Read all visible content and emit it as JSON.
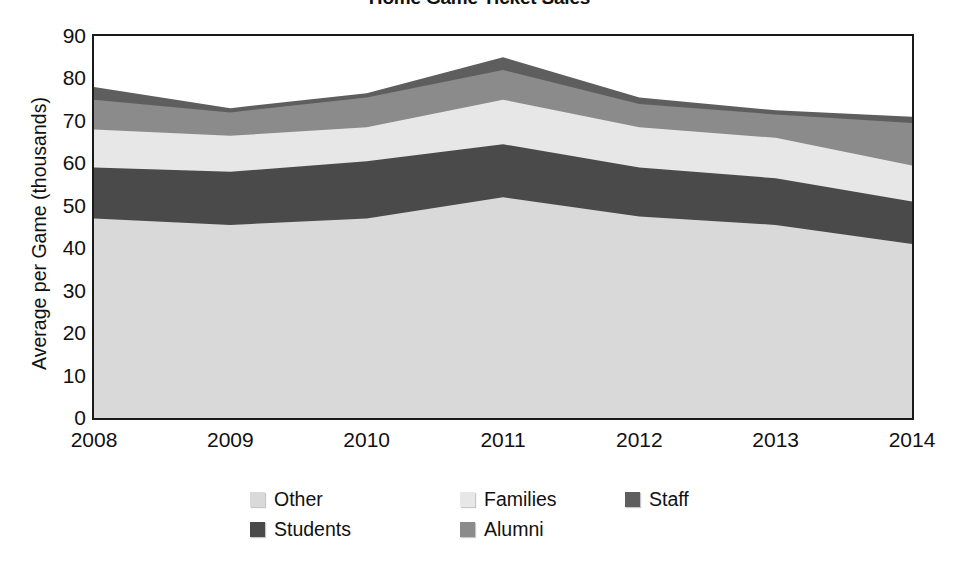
{
  "chart_data": {
    "type": "area",
    "stacked": true,
    "title": "Home Game Ticket Sales",
    "xlabel": "",
    "ylabel": "Average per Game (thousands)",
    "categories": [
      "2008",
      "2009",
      "2010",
      "2011",
      "2012",
      "2013",
      "2014"
    ],
    "x": [
      2008,
      2009,
      2010,
      2011,
      2012,
      2013,
      2014
    ],
    "ylim": [
      0,
      90
    ],
    "yticks": [
      "0",
      "10",
      "20",
      "30",
      "40",
      "50",
      "60",
      "70",
      "80",
      "90"
    ],
    "ytick_values": [
      0,
      10,
      20,
      30,
      40,
      50,
      60,
      70,
      80,
      90
    ],
    "grid": false,
    "legend_position": "bottom",
    "series": [
      {
        "name": "Other",
        "color": "#d9d9d9",
        "values": [
          47,
          45.5,
          47,
          52,
          47.5,
          45.5,
          41
        ],
        "cumulative": [
          47,
          45.5,
          47,
          52,
          47.5,
          45.5,
          41
        ]
      },
      {
        "name": "Students",
        "color": "#4a4a4a",
        "values": [
          12,
          12.5,
          13.5,
          12.5,
          11.5,
          11,
          10
        ],
        "cumulative": [
          59,
          58,
          60.5,
          64.5,
          59,
          56.5,
          51
        ]
      },
      {
        "name": "Families",
        "color": "#e7e7e7",
        "values": [
          9,
          8.5,
          8,
          10.5,
          9.5,
          9.5,
          8.5
        ],
        "cumulative": [
          68,
          66.5,
          68.5,
          75,
          68.5,
          66,
          59.5
        ]
      },
      {
        "name": "Alumni",
        "color": "#8b8b8b",
        "values": [
          7,
          5.5,
          7,
          7,
          5.5,
          5.5,
          10
        ],
        "cumulative": [
          75,
          72,
          75.5,
          82,
          74,
          71.5,
          69.5
        ]
      },
      {
        "name": "Staff",
        "color": "#5e5e5e",
        "values": [
          3,
          1,
          1,
          3,
          1.5,
          1,
          1.5
        ],
        "cumulative": [
          78,
          73,
          76.5,
          85,
          75.5,
          72.5,
          71
        ]
      }
    ],
    "legend_order": [
      "Other",
      "Families",
      "Staff",
      "Students",
      "Alumni"
    ]
  },
  "legend": {
    "items": [
      {
        "label": "Other",
        "color": "#d9d9d9",
        "row": 0,
        "col": 0
      },
      {
        "label": "Families",
        "color": "#e7e7e7",
        "row": 0,
        "col": 1
      },
      {
        "label": "Staff",
        "color": "#5e5e5e",
        "row": 0,
        "col": 2
      },
      {
        "label": "Students",
        "color": "#4a4a4a",
        "row": 1,
        "col": 0
      },
      {
        "label": "Alumni",
        "color": "#8b8b8b",
        "row": 1,
        "col": 1
      }
    ]
  },
  "axes": {
    "frame_color": "#1a1a1a",
    "plot_background": "#ffffff"
  }
}
